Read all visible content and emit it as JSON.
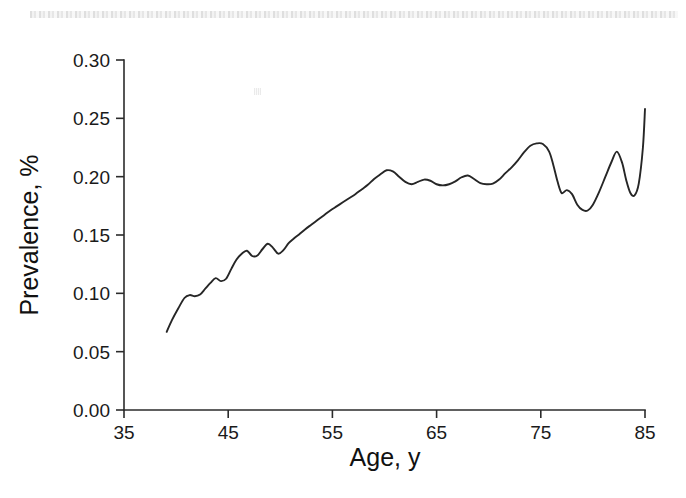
{
  "figure": {
    "background_color": "#ffffff",
    "curve_color": "#262626",
    "axis_color": "#2b2b2b",
    "scan_strip_name": "scanned-page-artifact"
  },
  "chart_data": {
    "type": "line",
    "title": "",
    "xlabel": "Age, y",
    "ylabel": "Prevalence, %",
    "xlim": [
      35,
      85
    ],
    "ylim": [
      0.0,
      0.3
    ],
    "xticks": [
      35,
      45,
      55,
      65,
      75,
      85
    ],
    "xticklabels": [
      "35",
      "45",
      "55",
      "65",
      "75",
      "85"
    ],
    "yticks": [
      0.0,
      0.05,
      0.1,
      0.15,
      0.2,
      0.25,
      0.3
    ],
    "yticklabels": [
      "0.00",
      "0.05",
      "0.10",
      "0.15",
      "0.20",
      "0.25",
      "0.30"
    ],
    "grid": false,
    "legend": null,
    "series": [
      {
        "name": "Prevalence",
        "x": [
          39.1,
          39.6,
          40.2,
          40.8,
          41.3,
          41.8,
          42.3,
          42.8,
          43.3,
          43.8,
          44.3,
          44.8,
          45.3,
          45.8,
          46.3,
          46.8,
          47.3,
          47.8,
          48.3,
          48.8,
          49.3,
          49.8,
          50.3,
          50.8,
          51.3,
          51.8,
          52.4,
          53.0,
          53.6,
          54.2,
          54.8,
          55.4,
          56.0,
          56.6,
          57.2,
          57.8,
          58.4,
          59.0,
          59.6,
          60.2,
          60.8,
          61.4,
          62.0,
          62.6,
          63.2,
          63.8,
          64.4,
          65.0,
          65.6,
          66.2,
          66.8,
          67.4,
          68.0,
          68.6,
          69.2,
          69.8,
          70.4,
          71.0,
          71.6,
          72.2,
          72.8,
          73.4,
          74.0,
          74.6,
          75.2,
          75.8,
          76.2,
          76.6,
          77.0,
          77.5,
          78.0,
          78.5,
          79.0,
          79.5,
          80.0,
          80.6,
          81.2,
          81.8,
          82.3,
          82.8,
          83.2,
          83.6,
          84.0,
          84.4,
          84.8,
          85.0
        ],
        "y": [
          0.067,
          0.077,
          0.087,
          0.096,
          0.0985,
          0.0975,
          0.099,
          0.104,
          0.109,
          0.113,
          0.1105,
          0.1125,
          0.121,
          0.129,
          0.134,
          0.1365,
          0.132,
          0.1325,
          0.138,
          0.1425,
          0.139,
          0.134,
          0.137,
          0.143,
          0.147,
          0.1505,
          0.155,
          0.159,
          0.163,
          0.167,
          0.171,
          0.1745,
          0.178,
          0.1815,
          0.185,
          0.189,
          0.193,
          0.198,
          0.202,
          0.2055,
          0.2045,
          0.2,
          0.1955,
          0.1935,
          0.1955,
          0.1975,
          0.1965,
          0.1935,
          0.1925,
          0.1935,
          0.196,
          0.1995,
          0.201,
          0.198,
          0.1945,
          0.1935,
          0.194,
          0.1975,
          0.203,
          0.208,
          0.214,
          0.221,
          0.2265,
          0.2285,
          0.228,
          0.2215,
          0.21,
          0.196,
          0.186,
          0.1885,
          0.185,
          0.176,
          0.1715,
          0.171,
          0.176,
          0.187,
          0.2,
          0.213,
          0.2215,
          0.212,
          0.197,
          0.186,
          0.184,
          0.194,
          0.225,
          0.258
        ]
      }
    ]
  }
}
